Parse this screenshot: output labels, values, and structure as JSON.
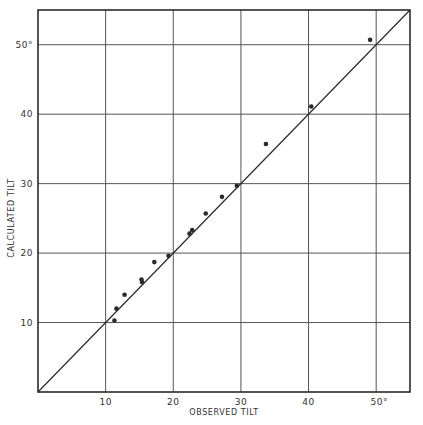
{
  "chart_data": {
    "type": "scatter",
    "title": "",
    "xlabel": "OBSERVED TILT",
    "ylabel": "CALCULATED TILT",
    "xlim": [
      0,
      55
    ],
    "ylim": [
      0,
      55
    ],
    "grid": true,
    "x_ticks": [
      10,
      20,
      30,
      40,
      50
    ],
    "y_ticks": [
      10,
      20,
      30,
      40,
      50
    ],
    "x_tick_labels": [
      "10",
      "20",
      "30",
      "40",
      "50°"
    ],
    "y_tick_labels": [
      "10",
      "20",
      "30",
      "40",
      "50°"
    ],
    "reference_line": {
      "from": [
        0,
        0
      ],
      "to": [
        55,
        55
      ],
      "label": "y = x"
    },
    "series": [
      {
        "name": "observations",
        "points": [
          {
            "x": 11.3,
            "y": 10.3
          },
          {
            "x": 11.6,
            "y": 12.0
          },
          {
            "x": 12.8,
            "y": 14.0
          },
          {
            "x": 15.3,
            "y": 16.2
          },
          {
            "x": 15.4,
            "y": 15.8
          },
          {
            "x": 17.2,
            "y": 18.7
          },
          {
            "x": 19.3,
            "y": 19.6
          },
          {
            "x": 22.4,
            "y": 22.8
          },
          {
            "x": 22.8,
            "y": 23.3
          },
          {
            "x": 24.8,
            "y": 25.7
          },
          {
            "x": 27.2,
            "y": 28.1
          },
          {
            "x": 29.4,
            "y": 29.7
          },
          {
            "x": 33.7,
            "y": 35.7
          },
          {
            "x": 40.4,
            "y": 41.1
          },
          {
            "x": 49.1,
            "y": 50.7
          }
        ]
      }
    ]
  },
  "colors": {
    "ink": "#2a2a2a",
    "grid": "#555555",
    "background": "#ffffff"
  }
}
